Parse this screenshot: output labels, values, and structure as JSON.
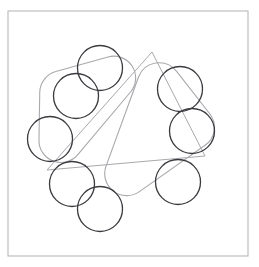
{
  "canvas": {
    "width": 259,
    "height": 267,
    "background": "#ffffff"
  },
  "frame": {
    "label": "outer-border",
    "x": 8,
    "y": 11,
    "width": 240,
    "height": 245,
    "stroke": "#b8b8b8",
    "stroke_width": 1.1,
    "fill": "none"
  },
  "colors": {
    "dark_stroke": "#3a3a3f",
    "light_stroke": "#a9a9ad",
    "frame_stroke": "#b8b8b8",
    "background": "#ffffff"
  },
  "geometry": {
    "center_x": 114,
    "center_y": 139,
    "petal_ring_radius": 70,
    "petal_circle_radius": 22.5,
    "rounded_triangle_circumradius": 84,
    "rounded_triangle_corner_radius": 20,
    "rounded_triangle_rotations_deg": [
      -12,
      48
    ],
    "straight_triangle_circumradius": 86,
    "straight_triangle_rotation_deg": -12
  },
  "petal_circles": [
    {
      "name": "petal-circle-top",
      "cx": 100,
      "cy": 68,
      "r": 22.5,
      "stroke": "#3a3a3f"
    },
    {
      "name": "petal-circle-upper-right",
      "cx": 180,
      "cy": 89,
      "r": 22.5,
      "stroke": "#3a3a3f"
    },
    {
      "name": "petal-circle-right",
      "cx": 192,
      "cy": 131,
      "r": 22.5,
      "stroke": "#3a3a3f"
    },
    {
      "name": "petal-circle-lower-right",
      "cx": 178,
      "cy": 182,
      "r": 22.5,
      "stroke": "#3a3a3f"
    },
    {
      "name": "petal-circle-bottom",
      "cx": 100,
      "cy": 209,
      "r": 22.5,
      "stroke": "#3a3a3f"
    },
    {
      "name": "petal-circle-upper-left",
      "cx": 76,
      "cy": 96,
      "r": 22.5,
      "stroke": "#3a3a3f"
    },
    {
      "name": "petal-circle-left",
      "cx": 50,
      "cy": 139,
      "r": 22.5,
      "stroke": "#3a3a3f"
    },
    {
      "name": "petal-circle-lower-left",
      "cx": 72,
      "cy": 184,
      "r": 22.5,
      "stroke": "#3a3a3f"
    }
  ],
  "rounded_triangles": [
    {
      "name": "rounded-triangle-a",
      "stroke": "#a9a9ad",
      "vertices": [
        [
          152,
          40
        ],
        [
          224,
          132
        ],
        [
          82,
          232
        ]
      ],
      "corner_radius": 22
    },
    {
      "name": "rounded-triangle-b",
      "stroke": "#a9a9ad",
      "vertices": [
        [
          40,
          76
        ],
        [
          176,
          38
        ],
        [
          38,
          202
        ]
      ],
      "corner_radius": 22
    }
  ],
  "straight_triangle": {
    "name": "straight-triangle",
    "stroke": "#a9a9ad",
    "vertices": [
      [
        152,
        52
      ],
      [
        205,
        156
      ],
      [
        47,
        170
      ]
    ]
  },
  "figure": {
    "element_counts": {
      "circles": 8,
      "rounded_triangles": 2,
      "straight_triangles": 1,
      "frames": 1
    }
  }
}
